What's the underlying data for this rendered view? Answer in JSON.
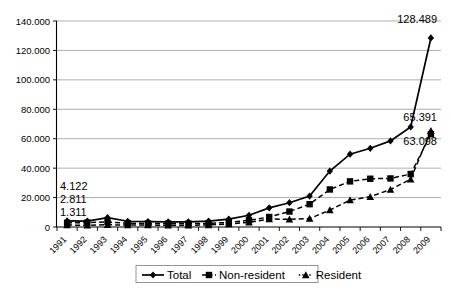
{
  "chart_data": {
    "type": "line",
    "title": "",
    "xlabel": "",
    "ylabel": "",
    "grid": true,
    "legend_position": "bottom",
    "ylim": [
      0,
      140000
    ],
    "ytick_labels": [
      "140.000",
      "120.000",
      "100.000",
      "80.000",
      "60.000",
      "40.000",
      "20.000",
      "0"
    ],
    "ytick_values": [
      140000,
      120000,
      100000,
      80000,
      60000,
      40000,
      20000,
      0
    ],
    "categories": [
      "1991",
      "1992",
      "1993",
      "1994",
      "1995",
      "1996",
      "1997",
      "1998",
      "1999",
      "2000",
      "2001",
      "2002",
      "2003",
      "2004",
      "2005",
      "2006",
      "2007",
      "2008",
      "2009"
    ],
    "series": [
      {
        "name": "Total",
        "marker": "diamond",
        "line": "solid",
        "values": [
          4122,
          4000,
          6400,
          3900,
          3700,
          3500,
          3500,
          4000,
          5400,
          8000,
          13000,
          16500,
          21000,
          38000,
          49500,
          53500,
          58500,
          68000,
          128489
        ]
      },
      {
        "name": "Non-resident",
        "marker": "square",
        "line": "dashed",
        "values": [
          2811,
          3000,
          3400,
          2600,
          2400,
          2300,
          2300,
          2500,
          3100,
          4600,
          6800,
          10500,
          15500,
          25500,
          31000,
          32800,
          33000,
          36000,
          63098
        ]
      },
      {
        "name": "Resident",
        "marker": "triangle",
        "line": "dashed",
        "values": [
          1311,
          1200,
          1500,
          1300,
          1300,
          1200,
          1200,
          1400,
          2000,
          3200,
          5400,
          5300,
          5700,
          11500,
          18300,
          20600,
          25500,
          32500,
          65391
        ]
      }
    ],
    "annotations": [
      {
        "text": "4.122",
        "series": "Total",
        "category": "1991",
        "value": 4122
      },
      {
        "text": "2.811",
        "series": "Non-resident",
        "category": "1991",
        "value": 2811
      },
      {
        "text": "1.311",
        "series": "Resident",
        "category": "1991",
        "value": 1311
      },
      {
        "text": "128.489",
        "series": "Total",
        "category": "2009",
        "value": 128489
      },
      {
        "text": "65.391",
        "series": "Resident",
        "category": "2009",
        "value": 65391
      },
      {
        "text": "63.098",
        "series": "Non-resident",
        "category": "2009",
        "value": 63098
      }
    ]
  },
  "legend": {
    "items": [
      {
        "label": "Total"
      },
      {
        "label": "Non-resident"
      },
      {
        "label": "Resident"
      }
    ]
  }
}
